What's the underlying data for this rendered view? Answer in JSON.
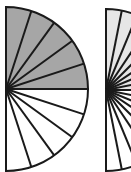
{
  "diagram": {
    "type": "fraction-semicircles",
    "colors": {
      "stroke": "#1a1a1a",
      "shaded_dark": "#a6a6a6",
      "shaded_light": "#e6e6e6",
      "unshaded": "#ffffff"
    },
    "figures": [
      {
        "id": "semicircle-1",
        "center": [
          6,
          89
        ],
        "radius": 82,
        "top_half": {
          "sectors": 5,
          "fill": "shaded_dark"
        },
        "bottom_half": {
          "sectors": 5,
          "fill": "unshaded"
        }
      },
      {
        "id": "semicircle-2",
        "center": [
          106,
          90
        ],
        "radius": 81,
        "top_half": {
          "sectors": 8,
          "fill": "shaded_light"
        },
        "bottom_half": {
          "sectors": 8,
          "fill": "unshaded"
        }
      }
    ]
  }
}
